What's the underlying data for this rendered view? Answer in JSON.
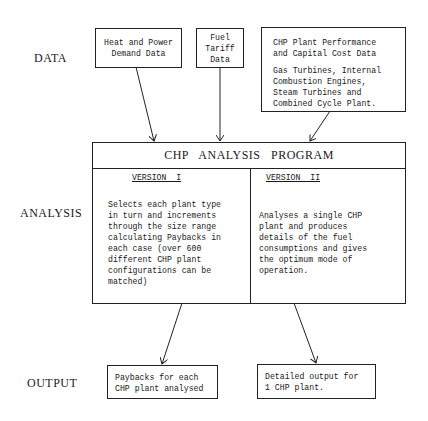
{
  "row_labels": {
    "data": "DATA",
    "analysis": "ANALYSIS",
    "output": "OUTPUT"
  },
  "data_inputs": [
    {
      "id": "heat-power",
      "lines": [
        "Heat and Power",
        "Demand Data"
      ]
    },
    {
      "id": "fuel-tariff",
      "lines": [
        "Fuel",
        "Tariff",
        "Data"
      ]
    },
    {
      "id": "chp-plant",
      "title_lines": [
        "CHP Plant Performance",
        "and Capital Cost Data"
      ],
      "body_lines": [
        "Gas Turbines, Internal",
        "Combustion Engines,",
        "Steam Turbines and",
        "Combined Cycle Plant."
      ]
    }
  ],
  "program": {
    "title": "CHP   ANALYSIS   PROGRAM",
    "versions": [
      {
        "heading": "VERSION  I",
        "lines": [
          "Selects each plant type",
          "in turn and increments",
          "through the size range",
          "calculating Paybacks in",
          "each case (over 600",
          "different CHP plant",
          "configurations can be",
          "matched)"
        ]
      },
      {
        "heading": "VERSION  II",
        "lines": [
          "Analyses a single CHP",
          "plant and produces",
          "details of the fuel",
          "consumptions and gives",
          "the optimum mode of",
          "operation."
        ]
      }
    ]
  },
  "outputs": [
    {
      "id": "paybacks",
      "lines": [
        "Paybacks for each",
        "CHP plant analysed"
      ]
    },
    {
      "id": "detailed",
      "lines": [
        "Detailed output for",
        "1 CHP plant."
      ]
    }
  ],
  "colors": {
    "line": "#222222",
    "background": "#ffffff",
    "text": "#1a1a1a"
  }
}
